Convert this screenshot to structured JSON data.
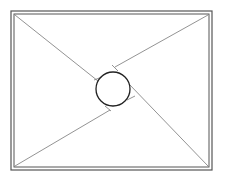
{
  "diagram": {
    "type": "geometry",
    "stroke_color": "#555555",
    "circle_color": "#222222",
    "frame": {
      "outer": [
        11,
        11,
        212,
        170
      ],
      "inner": [
        14,
        14,
        209,
        167
      ]
    },
    "circle": {
      "cx": 113,
      "cy": 89,
      "r": 17
    }
  },
  "caption": {
    "text": ""
  }
}
